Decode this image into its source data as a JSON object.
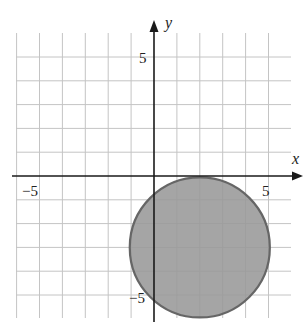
{
  "chart_data": {
    "type": "region",
    "title": "",
    "xlabel": "x",
    "ylabel": "y",
    "xlim": [
      -6,
      6
    ],
    "ylim": [
      -6,
      6
    ],
    "grid": true,
    "grid_step": 1,
    "tick_labels": {
      "x": [
        {
          "value": -5,
          "label": "−5"
        },
        {
          "value": 5,
          "label": "5"
        }
      ],
      "y": [
        {
          "value": 5,
          "label": "5"
        },
        {
          "value": -5,
          "label": "−5"
        }
      ]
    },
    "shapes": [
      {
        "kind": "filled-circle",
        "center": [
          2,
          -3
        ],
        "radius": 3,
        "fill": "#999999",
        "stroke": "#666666",
        "description": "Shaded disk (x-2)^2 + (y+3)^2 <= 9, tangent to x-axis at (2,0)"
      }
    ]
  },
  "labels": {
    "x_axis": "x",
    "y_axis": "y",
    "x_neg5": "−5",
    "x_pos5": "5",
    "y_pos5": "5",
    "y_neg5": "−5"
  },
  "colors": {
    "grid": "#c4c4c4",
    "axis": "#1a1a1a",
    "fill": "#999999",
    "stroke": "#666666"
  }
}
